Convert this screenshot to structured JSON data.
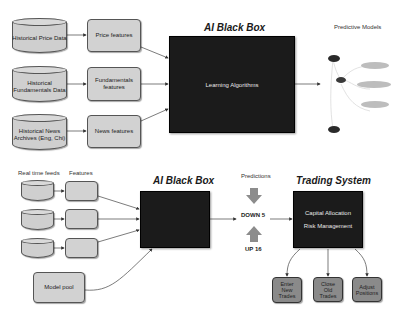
{
  "training": {
    "title": "AI Black Box",
    "black_box_label": "Learning Algorithms",
    "sources": [
      {
        "label": "Historical Price Data"
      },
      {
        "label": "Historical Fundamentals Data"
      },
      {
        "label": "Historical News Archives (Eng, Chi)"
      }
    ],
    "features": [
      {
        "label": "Price features"
      },
      {
        "label": "Fundamentals features"
      },
      {
        "label": "News features"
      }
    ],
    "models_caption": "Predictive Models",
    "model_nodes": [
      {
        "kind": "dark"
      },
      {
        "kind": "dark"
      },
      {
        "kind": "dark"
      },
      {
        "kind": "light"
      },
      {
        "kind": "light"
      },
      {
        "kind": "light"
      }
    ]
  },
  "live": {
    "feeds_caption": "Real time feeds",
    "features_caption": "Features",
    "title": "AI Black Box",
    "model_pool_label": "Model pool",
    "predictions_caption": "Predictions",
    "prediction_down": "DOWN 5",
    "prediction_up": "UP 16",
    "trading_title": "Trading System",
    "trading_lines": [
      "Capital Allocation",
      "Risk Management"
    ],
    "actions": [
      {
        "label": "Enter New Trades"
      },
      {
        "label": "Close Old Trades"
      },
      {
        "label": "Adjust Positions"
      }
    ]
  },
  "colors": {
    "black_box": "#1b1b1b",
    "shape_fill": "#d2d2d2",
    "action_fill": "#8a8a8a",
    "arrow_gray": "#8c8c8c"
  }
}
